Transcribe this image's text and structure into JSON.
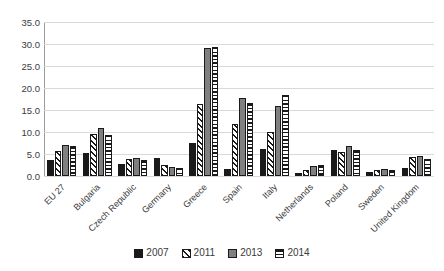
{
  "chart_data": {
    "type": "bar",
    "title": "",
    "xlabel": "",
    "ylabel": "",
    "ylim": [
      0,
      35
    ],
    "ytick_step": 5,
    "grid": true,
    "legend_position": "bottom",
    "yticks": [
      "35.0",
      "30.0",
      "25.0",
      "20.0",
      "15.0",
      "10.0",
      "5.0",
      "0.0"
    ],
    "categories": [
      "EU 27",
      "Bulgaria",
      "Czech Republic",
      "Germany",
      "Greece",
      "Spain",
      "Italy",
      "Netherlands",
      "Poland",
      "Sweden",
      "United Kingdom"
    ],
    "series": [
      {
        "name": "2007",
        "style": "solid-black",
        "color": "#1a1a1a",
        "values": [
          3.7,
          5.3,
          2.8,
          4.1,
          7.6,
          1.6,
          6.1,
          0.7,
          6.0,
          0.9,
          1.8
        ]
      },
      {
        "name": "2011",
        "style": "diagonal-hatch",
        "color": "#ffffff",
        "values": [
          5.6,
          9.6,
          3.8,
          2.4,
          16.4,
          11.8,
          9.9,
          1.4,
          5.5,
          1.3,
          4.4
        ]
      },
      {
        "name": "2013",
        "style": "solid-gray",
        "color": "#808080",
        "values": [
          7.0,
          10.8,
          4.1,
          2.1,
          29.1,
          17.8,
          15.9,
          2.2,
          6.9,
          1.5,
          4.6
        ]
      },
      {
        "name": "2014",
        "style": "horizontal-stripes",
        "color": "#ffffff",
        "values": [
          6.8,
          9.4,
          3.6,
          1.9,
          29.3,
          16.6,
          18.5,
          2.4,
          5.8,
          1.4,
          3.8
        ]
      }
    ]
  }
}
